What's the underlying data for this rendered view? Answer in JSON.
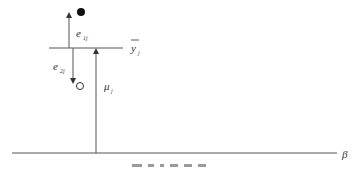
{
  "diagram": {
    "type": "vertical-decomposition",
    "colors": {
      "line": "#555555",
      "text": "#333333",
      "point": "#111111"
    },
    "labels": {
      "group_mean": "y",
      "group_mean_sub": "j",
      "mu": "μ",
      "mu_sub": "j",
      "e1": "e",
      "e1_sub": "1j",
      "e2": "e",
      "e2_sub": "2j",
      "axis": "β"
    },
    "points": [
      {
        "name": "observation-1",
        "style": "filled",
        "x": 81,
        "y": 12
      },
      {
        "name": "observation-2",
        "style": "open",
        "x": 80,
        "y": 86
      }
    ]
  }
}
